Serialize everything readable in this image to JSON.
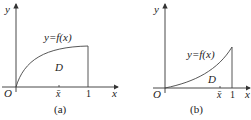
{
  "figures": [
    {
      "id": "a",
      "caption": "(a)",
      "function_label": "y=f(x)",
      "region_label": "D",
      "origin_label": "O",
      "x_axis_label": "x",
      "y_axis_label": "y",
      "xbar_label": "x̄",
      "one_label": "1",
      "curve": "concave increasing"
    },
    {
      "id": "b",
      "caption": "(b)",
      "function_label": "y=f(x)",
      "region_label": "D",
      "origin_label": "O",
      "x_axis_label": "x",
      "y_axis_label": "y",
      "xbar_label": "x̄",
      "one_label": "1",
      "curve": "convex increasing"
    }
  ],
  "colors": {
    "line": "#333333",
    "text": "#222222"
  }
}
